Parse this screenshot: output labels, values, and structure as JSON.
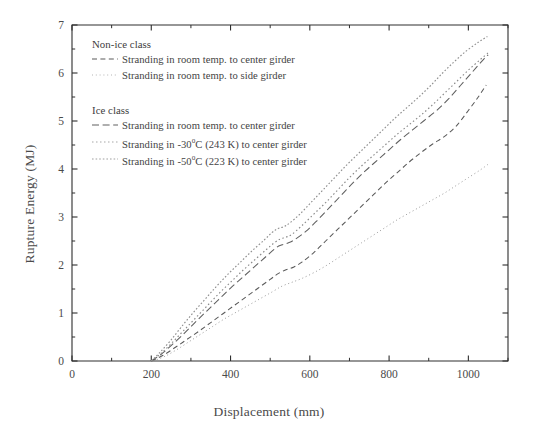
{
  "chart_data": {
    "type": "line",
    "title": "",
    "xlabel": "Displacement (mm)",
    "ylabel": "Rupture Energy (MJ)",
    "xlim": [
      0,
      1100
    ],
    "ylim": [
      0,
      7
    ],
    "xticks": [
      0,
      200,
      400,
      600,
      800,
      1000
    ],
    "yticks": [
      0,
      1,
      2,
      3,
      4,
      5,
      6,
      7
    ],
    "x_minor_step": 100,
    "y_minor_step": 0.5,
    "grid": false,
    "legend_position": "upper-left-inside",
    "legend_groups": [
      {
        "header": "Non-ice class",
        "entries": [
          {
            "label": "Stranding in room temp. to center girder",
            "style": "dashed",
            "series": "noniced-center"
          },
          {
            "label": "Stranding in room temp. to side girder",
            "style": "dotted-fine",
            "series": "noniced-side"
          }
        ]
      },
      {
        "header": "Ice class",
        "entries": [
          {
            "label": "Stranding in room temp. to center girder",
            "style": "dashed-long",
            "series": "ice-room-center"
          },
          {
            "label": "Stranding in -30°C (243 K) to center girder",
            "style": "dotted",
            "series": "ice-m30-center"
          },
          {
            "label": "Stranding in -50°C (223 K) to center girder",
            "style": "dotted-dense",
            "series": "ice-m50-center"
          }
        ]
      }
    ],
    "series": [
      {
        "name": "Non-ice class: Stranding in room temp. to center girder",
        "key": "noniced-center",
        "style": "dashed",
        "color": "#5a5a5a",
        "points": [
          [
            200,
            0.0
          ],
          [
            230,
            0.12
          ],
          [
            260,
            0.28
          ],
          [
            290,
            0.45
          ],
          [
            320,
            0.62
          ],
          [
            350,
            0.8
          ],
          [
            380,
            0.98
          ],
          [
            410,
            1.16
          ],
          [
            440,
            1.34
          ],
          [
            470,
            1.52
          ],
          [
            500,
            1.7
          ],
          [
            520,
            1.82
          ],
          [
            540,
            1.9
          ],
          [
            560,
            1.96
          ],
          [
            580,
            2.06
          ],
          [
            610,
            2.26
          ],
          [
            640,
            2.5
          ],
          [
            670,
            2.74
          ],
          [
            700,
            2.98
          ],
          [
            730,
            3.22
          ],
          [
            760,
            3.46
          ],
          [
            790,
            3.7
          ],
          [
            820,
            3.92
          ],
          [
            850,
            4.14
          ],
          [
            880,
            4.34
          ],
          [
            910,
            4.52
          ],
          [
            940,
            4.68
          ],
          [
            970,
            4.9
          ],
          [
            1000,
            5.22
          ],
          [
            1025,
            5.5
          ],
          [
            1045,
            5.75
          ]
        ]
      },
      {
        "name": "Non-ice class: Stranding in room temp. to side girder",
        "key": "noniced-side",
        "style": "dotted-fine",
        "color": "#9a9a9a",
        "points": [
          [
            205,
            0.0
          ],
          [
            235,
            0.1
          ],
          [
            265,
            0.24
          ],
          [
            295,
            0.4
          ],
          [
            325,
            0.56
          ],
          [
            355,
            0.72
          ],
          [
            385,
            0.88
          ],
          [
            415,
            1.02
          ],
          [
            445,
            1.16
          ],
          [
            475,
            1.3
          ],
          [
            505,
            1.44
          ],
          [
            530,
            1.56
          ],
          [
            555,
            1.64
          ],
          [
            580,
            1.72
          ],
          [
            610,
            1.84
          ],
          [
            640,
            1.98
          ],
          [
            670,
            2.14
          ],
          [
            700,
            2.3
          ],
          [
            730,
            2.46
          ],
          [
            760,
            2.62
          ],
          [
            790,
            2.78
          ],
          [
            820,
            2.94
          ],
          [
            850,
            3.08
          ],
          [
            880,
            3.22
          ],
          [
            910,
            3.36
          ],
          [
            940,
            3.5
          ],
          [
            970,
            3.66
          ],
          [
            1000,
            3.82
          ],
          [
            1030,
            3.98
          ],
          [
            1050,
            4.1
          ]
        ]
      },
      {
        "name": "Ice class: Stranding in room temp. to center girder",
        "key": "ice-room-center",
        "style": "dashed-long",
        "color": "#606060",
        "points": [
          [
            200,
            0.0
          ],
          [
            225,
            0.14
          ],
          [
            250,
            0.32
          ],
          [
            280,
            0.55
          ],
          [
            310,
            0.8
          ],
          [
            340,
            1.04
          ],
          [
            370,
            1.28
          ],
          [
            400,
            1.52
          ],
          [
            430,
            1.74
          ],
          [
            460,
            1.96
          ],
          [
            490,
            2.18
          ],
          [
            515,
            2.36
          ],
          [
            530,
            2.42
          ],
          [
            545,
            2.46
          ],
          [
            560,
            2.52
          ],
          [
            590,
            2.7
          ],
          [
            620,
            2.94
          ],
          [
            650,
            3.2
          ],
          [
            680,
            3.46
          ],
          [
            710,
            3.72
          ],
          [
            740,
            3.96
          ],
          [
            770,
            4.18
          ],
          [
            800,
            4.4
          ],
          [
            830,
            4.62
          ],
          [
            860,
            4.82
          ],
          [
            890,
            5.02
          ],
          [
            920,
            5.22
          ],
          [
            950,
            5.46
          ],
          [
            980,
            5.74
          ],
          [
            1010,
            6.02
          ],
          [
            1040,
            6.3
          ],
          [
            1050,
            6.38
          ]
        ]
      },
      {
        "name": "Ice class: Stranding in -30°C (243 K) to center girder",
        "key": "ice-m30-center",
        "style": "dotted",
        "color": "#8a8a8a",
        "points": [
          [
            200,
            0.0
          ],
          [
            225,
            0.16
          ],
          [
            250,
            0.36
          ],
          [
            280,
            0.62
          ],
          [
            310,
            0.88
          ],
          [
            340,
            1.14
          ],
          [
            370,
            1.4
          ],
          [
            400,
            1.64
          ],
          [
            430,
            1.88
          ],
          [
            460,
            2.1
          ],
          [
            490,
            2.32
          ],
          [
            510,
            2.46
          ],
          [
            525,
            2.54
          ],
          [
            540,
            2.58
          ],
          [
            555,
            2.64
          ],
          [
            580,
            2.82
          ],
          [
            610,
            3.06
          ],
          [
            640,
            3.3
          ],
          [
            670,
            3.56
          ],
          [
            700,
            3.82
          ],
          [
            730,
            4.06
          ],
          [
            760,
            4.28
          ],
          [
            790,
            4.5
          ],
          [
            820,
            4.72
          ],
          [
            850,
            4.92
          ],
          [
            880,
            5.12
          ],
          [
            910,
            5.34
          ],
          [
            940,
            5.58
          ],
          [
            970,
            5.82
          ],
          [
            1000,
            6.06
          ],
          [
            1030,
            6.28
          ],
          [
            1050,
            6.42
          ]
        ]
      },
      {
        "name": "Ice class: Stranding in -50°C (223 K) to center girder",
        "key": "ice-m50-center",
        "style": "dotted-dense",
        "color": "#8f8f8f",
        "points": [
          [
            200,
            0.0
          ],
          [
            222,
            0.18
          ],
          [
            248,
            0.42
          ],
          [
            275,
            0.7
          ],
          [
            305,
            1.0
          ],
          [
            335,
            1.28
          ],
          [
            365,
            1.56
          ],
          [
            395,
            1.82
          ],
          [
            425,
            2.06
          ],
          [
            455,
            2.3
          ],
          [
            485,
            2.52
          ],
          [
            505,
            2.68
          ],
          [
            520,
            2.76
          ],
          [
            535,
            2.8
          ],
          [
            550,
            2.88
          ],
          [
            575,
            3.06
          ],
          [
            605,
            3.32
          ],
          [
            635,
            3.58
          ],
          [
            665,
            3.84
          ],
          [
            695,
            4.1
          ],
          [
            725,
            4.34
          ],
          [
            755,
            4.58
          ],
          [
            785,
            4.82
          ],
          [
            815,
            5.06
          ],
          [
            845,
            5.28
          ],
          [
            875,
            5.5
          ],
          [
            905,
            5.74
          ],
          [
            935,
            6.0
          ],
          [
            965,
            6.24
          ],
          [
            995,
            6.46
          ],
          [
            1025,
            6.64
          ],
          [
            1048,
            6.76
          ]
        ]
      }
    ]
  },
  "axes": {
    "x_tick_labels": [
      "0",
      "200",
      "400",
      "600",
      "800",
      "1000"
    ],
    "y_tick_labels": [
      "0",
      "1",
      "2",
      "3",
      "4",
      "5",
      "6",
      "7"
    ]
  },
  "legend": {
    "group1_header": "Non-ice class",
    "group1_entry1": "Stranding in room temp. to center girder",
    "group1_entry2": "Stranding in room temp. to side girder",
    "group2_header": "Ice class",
    "group2_entry1": "Stranding in room temp. to center girder",
    "group2_entry2_pre": "Stranding in -30",
    "group2_entry2_sup": "o",
    "group2_entry2_post": "C (243 K) to center girder",
    "group2_entry3_pre": "Stranding in -50",
    "group2_entry3_sup": "o",
    "group2_entry3_post": "C (223 K) to center girder"
  },
  "colors": {
    "axis": "#2e2e2e",
    "text": "#434343",
    "background": "#ffffff"
  }
}
